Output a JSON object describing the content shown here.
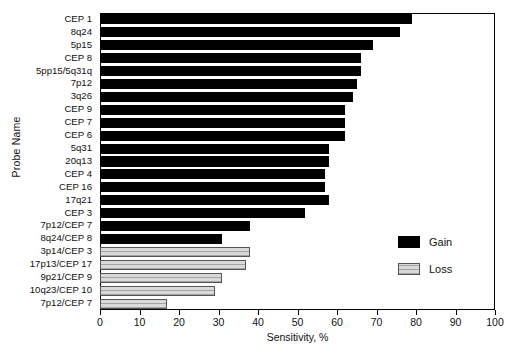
{
  "chart_data": {
    "type": "bar",
    "orientation": "horizontal",
    "title": "",
    "xlabel": "Sensitivity, %",
    "ylabel": "Probe Name",
    "xlim": [
      0,
      100
    ],
    "xticks": [
      0,
      10,
      20,
      30,
      40,
      50,
      60,
      70,
      80,
      90,
      100
    ],
    "xtick_labels": [
      "0",
      "10",
      "20",
      "30",
      "40",
      "50",
      "60",
      "70",
      "80",
      "90",
      "100"
    ],
    "grid": false,
    "legend_position": "center-right",
    "legend": [
      {
        "name": "Gain",
        "color": "#000000"
      },
      {
        "name": "Loss",
        "color": "#d9d9d9"
      }
    ],
    "categories": [
      "CEP 1",
      "8q24",
      "5p15",
      "CEP 8",
      "5pp15/5q31q",
      "7p12",
      "3q26",
      "CEP 9",
      "CEP 7",
      "CEP 6",
      "5q31",
      "20q13",
      "CEP 4",
      "CEP 16",
      "17q21",
      "CEP 3",
      "7p12/CEP 7",
      "8q24/CEP 8",
      "3p14/CEP 3",
      "17p13/CEP 17",
      "9p21/CEP 9",
      "10q23/CEP 10",
      "7p12/CEP 7"
    ],
    "values": [
      79,
      76,
      69,
      66,
      66,
      65,
      64,
      62,
      62,
      62,
      58,
      58,
      57,
      57,
      58,
      52,
      38,
      31,
      38,
      37,
      31,
      29,
      17
    ],
    "groups": [
      "Gain",
      "Gain",
      "Gain",
      "Gain",
      "Gain",
      "Gain",
      "Gain",
      "Gain",
      "Gain",
      "Gain",
      "Gain",
      "Gain",
      "Gain",
      "Gain",
      "Gain",
      "Gain",
      "Gain",
      "Gain",
      "Loss",
      "Loss",
      "Loss",
      "Loss",
      "Loss"
    ]
  }
}
